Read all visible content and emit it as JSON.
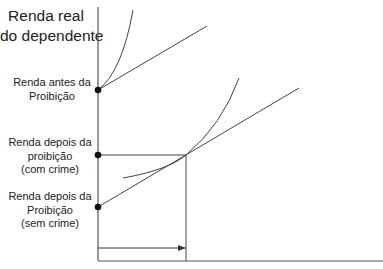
{
  "diagram": {
    "y_axis_title": [
      "Renda real",
      "do dependente"
    ],
    "labels": {
      "before": [
        "Renda antes da",
        "Proibição"
      ],
      "after_crime": [
        "Renda depois da",
        "proibição",
        "(com crime)"
      ],
      "after_no_crime": [
        "Renda depois da",
        "Proibição",
        "(sem crime)"
      ]
    },
    "colors": {
      "line": "#444444",
      "dot": "#111111",
      "text": "#222222"
    }
  }
}
